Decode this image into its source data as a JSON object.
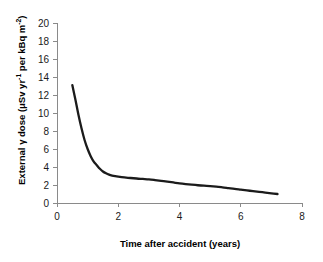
{
  "chart_data": {
    "type": "line",
    "title": "",
    "xlabel": "Time after accident (years)",
    "ylabel": "External γ dose  (μSv yr⁻¹ per kBq m⁻²)",
    "ylabel_parts": {
      "lead": "External γ dose  (μSv yr",
      "sup1": "-1",
      "middle": " per kBq m",
      "sup2": "-2",
      "tail": ")"
    },
    "xlim": [
      0,
      8
    ],
    "ylim": [
      0,
      20
    ],
    "xticks": [
      0,
      2,
      4,
      6,
      8
    ],
    "xtick_labels": [
      "0",
      "2",
      "4",
      "6",
      "8"
    ],
    "yticks": [
      0,
      2,
      4,
      6,
      8,
      10,
      12,
      14,
      16,
      18,
      20
    ],
    "ytick_labels": [
      "0",
      "2",
      "4",
      "6",
      "8",
      "10",
      "12",
      "14",
      "16",
      "18",
      "20"
    ],
    "grid": false,
    "legend": null,
    "series": [
      {
        "name": "External gamma dose rate",
        "color": "#1b1b1b",
        "x": [
          0.5,
          0.6,
          0.7,
          0.8,
          0.9,
          1.0,
          1.1,
          1.2,
          1.3,
          1.4,
          1.5,
          1.6,
          1.7,
          1.8,
          1.9,
          2.0,
          2.2,
          2.4,
          2.6,
          2.8,
          3.0,
          3.2,
          3.4,
          3.6,
          3.8,
          4.0,
          4.2,
          4.4,
          4.6,
          4.8,
          5.0,
          5.2,
          5.4,
          5.6,
          5.8,
          6.0,
          6.2,
          6.4,
          6.6,
          6.8,
          7.0,
          7.2
        ],
        "y": [
          13.1,
          11.5,
          9.8,
          8.3,
          7.0,
          6.0,
          5.2,
          4.6,
          4.2,
          3.8,
          3.5,
          3.3,
          3.15,
          3.05,
          2.98,
          2.93,
          2.85,
          2.78,
          2.72,
          2.67,
          2.62,
          2.55,
          2.47,
          2.38,
          2.28,
          2.18,
          2.1,
          2.03,
          1.97,
          1.92,
          1.88,
          1.82,
          1.74,
          1.65,
          1.56,
          1.48,
          1.4,
          1.32,
          1.24,
          1.16,
          1.08,
          1.0
        ]
      }
    ]
  },
  "axes": {
    "x_axis_name": "x-axis",
    "y_axis_name": "y-axis"
  }
}
